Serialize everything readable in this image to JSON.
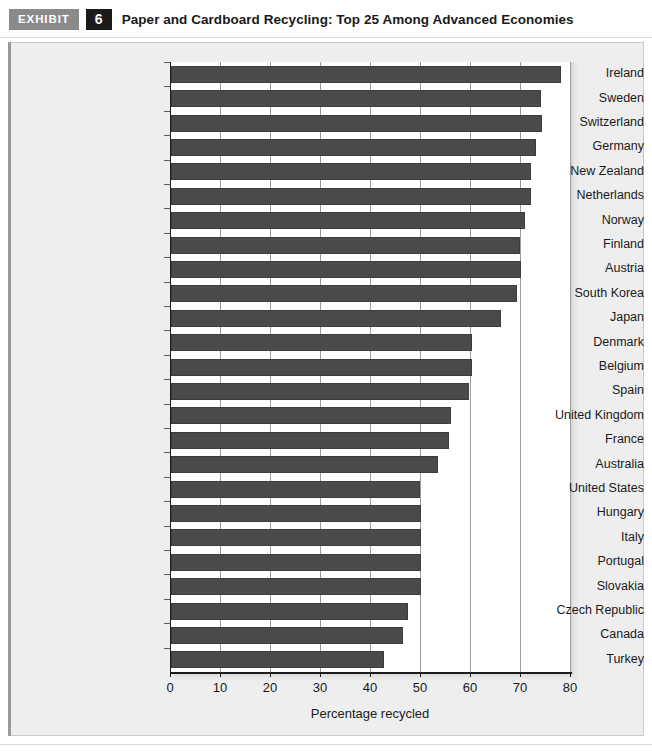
{
  "header": {
    "tag": "EXHIBIT",
    "number": "6",
    "title": "Paper and Cardboard Recycling: Top 25 Among Advanced Economies"
  },
  "colors": {
    "bar": "#4a4a4a",
    "bar_border": "#3d3d3d",
    "panel_background": "#eeeeee",
    "plot_background": "#ffffff",
    "gridline": "#9d9d9d",
    "axis": "#1c1c1c",
    "tag_background": "#8a8a8a",
    "number_background": "#1a1a1a",
    "text": "#1a1a1a"
  },
  "chart_data": {
    "type": "bar",
    "orientation": "horizontal",
    "title": "Paper and Cardboard Recycling: Top 25 Among Advanced Economies",
    "xlabel": "Percentage recycled",
    "ylabel": "",
    "xlim": [
      0,
      80
    ],
    "xticks": [
      0,
      10,
      20,
      30,
      40,
      50,
      60,
      70,
      80
    ],
    "xtick_labels": [
      "0",
      "10",
      "20",
      "30",
      "40",
      "50",
      "60",
      "70",
      "80"
    ],
    "grid": "vertical",
    "legend": null,
    "categories": [
      "Ireland",
      "Sweden",
      "Switzerland",
      "Germany",
      "New Zealand",
      "Netherlands",
      "Norway",
      "Finland",
      "Austria",
      "South Korea",
      "Japan",
      "Denmark",
      "Belgium",
      "Spain",
      "United Kingdom",
      "France",
      "Australia",
      "United States",
      "Hungary",
      "Italy",
      "Portugal",
      "Slovakia",
      "Czech Republic",
      "Canada",
      "Turkey"
    ],
    "values": [
      77.9,
      74.0,
      74.1,
      73.0,
      71.9,
      72.0,
      70.8,
      69.7,
      69.9,
      69.2,
      65.9,
      60.1,
      60.2,
      59.6,
      56.0,
      55.6,
      53.4,
      49.8,
      50.0,
      50.0,
      50.0,
      50.0,
      47.3,
      46.3,
      42.5
    ]
  }
}
